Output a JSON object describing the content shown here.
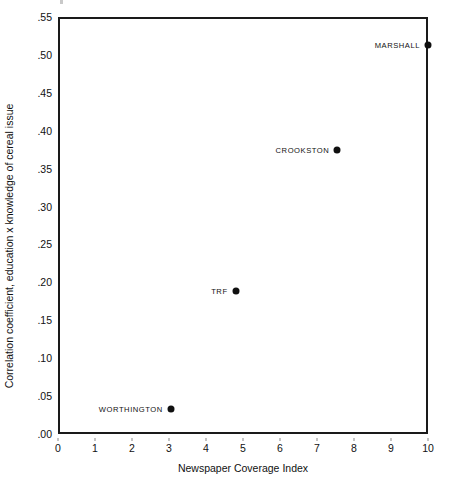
{
  "chart_data": {
    "type": "scatter",
    "title": "",
    "xlabel": "Newspaper Coverage Index",
    "ylabel": "Correlation coefficient, education x knowledge of cereal issue",
    "xlim": [
      0,
      10
    ],
    "ylim": [
      0.0,
      0.55
    ],
    "grid": false,
    "legend": "none",
    "xticks": [
      "0",
      "1",
      "2",
      "3",
      "4",
      "5",
      "6",
      "7",
      "8",
      "9",
      "10"
    ],
    "xtick_values": [
      0,
      1,
      2,
      3,
      4,
      5,
      6,
      7,
      8,
      9,
      10
    ],
    "yticks": [
      ".00",
      ".05",
      ".10",
      ".15",
      ".20",
      ".25",
      ".30",
      ".35",
      ".40",
      ".45",
      ".50",
      ".55"
    ],
    "ytick_values": [
      0.0,
      0.05,
      0.1,
      0.15,
      0.2,
      0.25,
      0.3,
      0.35,
      0.4,
      0.45,
      0.5,
      0.55
    ],
    "points": [
      {
        "label": "MARSHALL",
        "x": 10.0,
        "y": 0.513,
        "label_side": "left"
      },
      {
        "label": "CROOKSTON",
        "x": 7.55,
        "y": 0.375,
        "label_side": "left"
      },
      {
        "label": "TRF",
        "x": 4.8,
        "y": 0.188,
        "label_side": "left"
      },
      {
        "label": "WORTHINGTON",
        "x": 3.05,
        "y": 0.033,
        "label_side": "left"
      }
    ],
    "marker_color": "#101010",
    "axis_color": "#1a1a1a",
    "background_color": "#ffffff"
  }
}
